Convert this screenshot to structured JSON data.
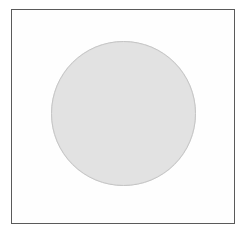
{
  "figure": {
    "canvas": {
      "width": 244,
      "height": 238,
      "background_color": "#ffffff"
    },
    "frame": {
      "name": "frame-rect",
      "shape": "rectangle",
      "x": 11,
      "y": 9,
      "width": 224,
      "height": 215,
      "fill_color": "#fefefe",
      "border_color": "#5a5a5a",
      "border_width": 1
    },
    "shapes": [
      {
        "name": "circle",
        "shape": "circle",
        "center_x": 123,
        "center_y": 113,
        "diameter": 145,
        "radius": 72,
        "fill_color": "#e2e2e2",
        "outline_color": "#c9c9c9",
        "outline_width": 1
      }
    ],
    "labels": {
      "title": "",
      "caption": "",
      "alt_text": "A light gray filled circle centered inside a thin dark rectangular border on a white background."
    }
  }
}
